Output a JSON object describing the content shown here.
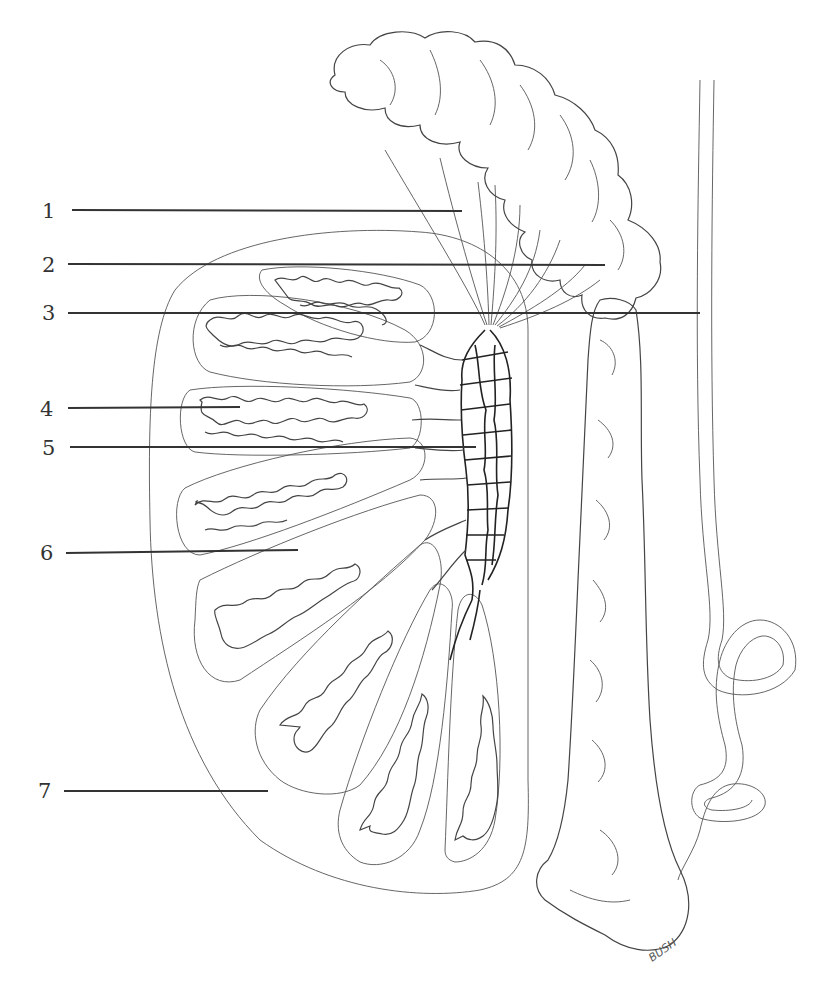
{
  "figure": {
    "labels": [
      {
        "number": "1"
      },
      {
        "number": "2"
      },
      {
        "number": "3"
      },
      {
        "number": "4"
      },
      {
        "number": "5"
      },
      {
        "number": "6"
      },
      {
        "number": "7"
      }
    ],
    "signature": "BUSH"
  },
  "colors": {
    "ink": "#333333",
    "background": "#ffffff"
  }
}
